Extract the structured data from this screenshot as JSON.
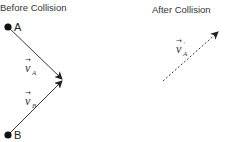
{
  "titles": {
    "before": "Before Collision",
    "after": "After Collision"
  },
  "points": {
    "a": {
      "label": "A",
      "x": 8,
      "y": 27
    },
    "b": {
      "label": "B",
      "x": 8,
      "y": 135
    }
  },
  "vectors": {
    "va": {
      "symbol": "v",
      "subscript": "A",
      "prime": "",
      "arrow": "→"
    },
    "vb": {
      "symbol": "v",
      "subscript": "B",
      "prime": "",
      "arrow": "→"
    },
    "va_after": {
      "symbol": "v",
      "subscript": "A",
      "prime": "'",
      "arrow": "→"
    }
  },
  "colors": {
    "line": "#222222",
    "dot": "#111111",
    "text": "#333333"
  }
}
